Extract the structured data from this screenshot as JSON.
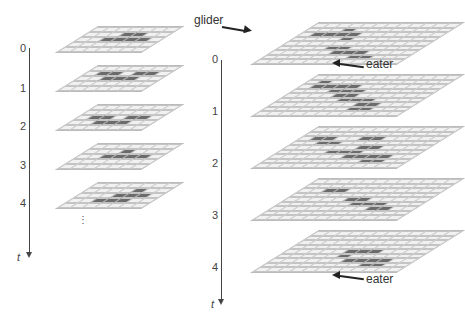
{
  "left": {
    "axis_label": "t",
    "ticks": [
      "0",
      "1",
      "2",
      "3",
      "4"
    ],
    "continuation": "⋮",
    "cols": 7,
    "rows": 5,
    "frames": [
      [
        [
          0,
          0,
          0,
          0,
          0,
          0,
          0
        ],
        [
          0,
          0,
          0,
          1,
          1,
          0,
          0
        ],
        [
          0,
          0,
          1,
          1,
          1,
          1,
          0
        ],
        [
          0,
          0,
          0,
          0,
          0,
          0,
          0
        ],
        [
          0,
          0,
          0,
          0,
          0,
          0,
          0
        ]
      ],
      [
        [
          0,
          0,
          0,
          0,
          0,
          0,
          0
        ],
        [
          0,
          1,
          1,
          0,
          1,
          1,
          0
        ],
        [
          0,
          0,
          1,
          1,
          1,
          0,
          0
        ],
        [
          0,
          0,
          0,
          0,
          0,
          0,
          0
        ],
        [
          0,
          0,
          0,
          0,
          0,
          0,
          0
        ]
      ],
      [
        [
          0,
          0,
          0,
          0,
          0,
          0,
          0
        ],
        [
          0,
          0,
          0,
          0,
          0,
          0,
          0
        ],
        [
          0,
          1,
          1,
          0,
          1,
          1,
          0
        ],
        [
          0,
          0,
          1,
          1,
          1,
          0,
          0
        ],
        [
          0,
          0,
          0,
          0,
          0,
          0,
          0
        ]
      ],
      [
        [
          0,
          0,
          0,
          0,
          0,
          0,
          0
        ],
        [
          0,
          0,
          0,
          1,
          0,
          0,
          0
        ],
        [
          0,
          0,
          1,
          1,
          1,
          1,
          0
        ],
        [
          0,
          0,
          0,
          0,
          0,
          0,
          0
        ],
        [
          0,
          0,
          0,
          0,
          0,
          0,
          0
        ]
      ],
      [
        [
          0,
          0,
          0,
          0,
          0,
          0,
          0
        ],
        [
          0,
          0,
          0,
          0,
          1,
          0,
          0
        ],
        [
          0,
          0,
          0,
          1,
          1,
          1,
          0
        ],
        [
          0,
          0,
          1,
          1,
          1,
          0,
          0
        ],
        [
          0,
          0,
          0,
          0,
          0,
          0,
          0
        ]
      ]
    ]
  },
  "right": {
    "axis_label": "t",
    "ticks": [
      "0",
      "1",
      "2",
      "3",
      "4"
    ],
    "cols": 12,
    "rows": 9,
    "labels": {
      "glider": "glider",
      "eater_top": "eater",
      "eater_bottom": "eater"
    },
    "frames": [
      [
        [
          0,
          0,
          0,
          0,
          0,
          0,
          0,
          0,
          0,
          0,
          0,
          0
        ],
        [
          0,
          0,
          0,
          1,
          0,
          0,
          0,
          0,
          0,
          0,
          0,
          0
        ],
        [
          0,
          1,
          1,
          1,
          1,
          0,
          0,
          0,
          0,
          0,
          0,
          0
        ],
        [
          0,
          0,
          0,
          0,
          1,
          0,
          0,
          0,
          0,
          0,
          0,
          0
        ],
        [
          0,
          0,
          0,
          0,
          0,
          0,
          0,
          0,
          0,
          0,
          0,
          0
        ],
        [
          0,
          0,
          0,
          0,
          1,
          1,
          0,
          0,
          0,
          0,
          0,
          0
        ],
        [
          0,
          0,
          0,
          0,
          0,
          1,
          1,
          1,
          0,
          0,
          0,
          0
        ],
        [
          0,
          0,
          0,
          0,
          0,
          0,
          0,
          1,
          1,
          0,
          0,
          0
        ],
        [
          0,
          0,
          0,
          0,
          0,
          0,
          0,
          0,
          0,
          0,
          0,
          0
        ]
      ],
      [
        [
          0,
          0,
          0,
          0,
          0,
          0,
          0,
          0,
          0,
          0,
          0,
          0
        ],
        [
          0,
          1,
          0,
          0,
          0,
          0,
          0,
          0,
          0,
          0,
          0,
          0
        ],
        [
          0,
          1,
          1,
          1,
          1,
          0,
          0,
          0,
          0,
          0,
          0,
          0
        ],
        [
          0,
          0,
          0,
          1,
          1,
          1,
          0,
          0,
          0,
          0,
          0,
          0
        ],
        [
          0,
          0,
          0,
          0,
          1,
          1,
          0,
          0,
          0,
          0,
          0,
          0
        ],
        [
          0,
          0,
          0,
          0,
          0,
          1,
          1,
          1,
          0,
          0,
          0,
          0
        ],
        [
          0,
          0,
          0,
          0,
          0,
          0,
          0,
          1,
          1,
          0,
          0,
          0
        ],
        [
          0,
          0,
          0,
          0,
          0,
          0,
          0,
          1,
          1,
          0,
          0,
          0
        ],
        [
          0,
          0,
          0,
          0,
          0,
          0,
          0,
          0,
          0,
          0,
          0,
          0
        ]
      ],
      [
        [
          0,
          0,
          0,
          0,
          0,
          0,
          0,
          0,
          0,
          0,
          0,
          0
        ],
        [
          0,
          0,
          0,
          0,
          0,
          0,
          0,
          0,
          0,
          0,
          0,
          0
        ],
        [
          0,
          1,
          1,
          0,
          0,
          1,
          1,
          0,
          0,
          0,
          0,
          0
        ],
        [
          0,
          0,
          1,
          1,
          0,
          0,
          0,
          0,
          0,
          0,
          0,
          0
        ],
        [
          0,
          0,
          0,
          0,
          0,
          0,
          1,
          1,
          0,
          0,
          0,
          0
        ],
        [
          0,
          0,
          0,
          0,
          1,
          1,
          1,
          0,
          0,
          0,
          0,
          0
        ],
        [
          0,
          0,
          0,
          0,
          0,
          0,
          1,
          1,
          1,
          1,
          0,
          0
        ],
        [
          0,
          0,
          0,
          0,
          0,
          0,
          0,
          0,
          1,
          1,
          0,
          0
        ],
        [
          0,
          0,
          0,
          0,
          0,
          0,
          0,
          0,
          0,
          0,
          0,
          0
        ]
      ],
      [
        [
          0,
          0,
          0,
          0,
          0,
          0,
          0,
          0,
          0,
          0,
          0,
          0
        ],
        [
          0,
          0,
          0,
          0,
          0,
          0,
          0,
          0,
          0,
          0,
          0,
          0
        ],
        [
          0,
          0,
          1,
          1,
          0,
          0,
          0,
          0,
          0,
          0,
          0,
          0
        ],
        [
          0,
          0,
          0,
          0,
          0,
          0,
          0,
          0,
          0,
          0,
          0,
          0
        ],
        [
          0,
          0,
          0,
          0,
          0,
          1,
          1,
          0,
          0,
          0,
          0,
          0
        ],
        [
          0,
          0,
          0,
          0,
          0,
          0,
          1,
          1,
          1,
          0,
          0,
          0
        ],
        [
          0,
          0,
          0,
          0,
          0,
          0,
          0,
          0,
          1,
          1,
          0,
          0
        ],
        [
          0,
          0,
          0,
          0,
          0,
          0,
          0,
          0,
          0,
          0,
          0,
          0
        ],
        [
          0,
          0,
          0,
          0,
          0,
          0,
          0,
          0,
          0,
          0,
          0,
          0
        ]
      ],
      [
        [
          0,
          0,
          0,
          0,
          0,
          0,
          0,
          0,
          0,
          0,
          0,
          0
        ],
        [
          0,
          0,
          0,
          0,
          0,
          0,
          0,
          0,
          0,
          0,
          0,
          0
        ],
        [
          0,
          0,
          0,
          0,
          0,
          0,
          0,
          0,
          0,
          0,
          0,
          0
        ],
        [
          0,
          0,
          0,
          0,
          0,
          0,
          0,
          0,
          0,
          0,
          0,
          0
        ],
        [
          0,
          0,
          0,
          0,
          0,
          1,
          1,
          1,
          0,
          0,
          0,
          0
        ],
        [
          0,
          0,
          0,
          0,
          0,
          1,
          0,
          0,
          0,
          0,
          0,
          0
        ],
        [
          0,
          0,
          0,
          0,
          0,
          0,
          1,
          1,
          1,
          1,
          0,
          0
        ],
        [
          0,
          0,
          0,
          0,
          0,
          0,
          0,
          0,
          1,
          1,
          0,
          0
        ],
        [
          0,
          0,
          0,
          0,
          0,
          0,
          0,
          0,
          0,
          0,
          0,
          0
        ]
      ]
    ]
  }
}
